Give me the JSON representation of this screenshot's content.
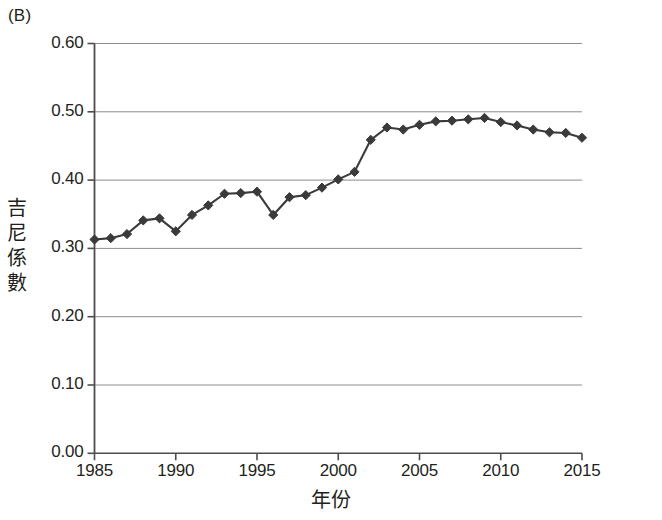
{
  "panel": {
    "label": "(B)"
  },
  "axes": {
    "y_label_chars": [
      "吉",
      "尼",
      "係",
      "數"
    ],
    "y_label": "吉尼係數",
    "x_label": "年份",
    "y_ticks": [
      "0.00",
      "0.10",
      "0.20",
      "0.30",
      "0.40",
      "0.50",
      "0.60"
    ],
    "x_ticks": [
      "1985",
      "1990",
      "1995",
      "2000",
      "2005",
      "2010",
      "2015"
    ]
  },
  "style": {
    "line_color": "#3a3a3a",
    "marker_color": "#3a3a3a",
    "grid_color": "#8c8c8c",
    "axis_color": "#4d4d4d",
    "text_color": "#231f20"
  },
  "chart_data": {
    "type": "line",
    "title": "(B)",
    "xlabel": "年份",
    "ylabel": "吉尼係數",
    "xlim": [
      1985,
      2015
    ],
    "ylim": [
      0.0,
      0.6
    ],
    "ytick_values": [
      0.0,
      0.1,
      0.2,
      0.3,
      0.4,
      0.5,
      0.6
    ],
    "xtick_values": [
      1985,
      1990,
      1995,
      2000,
      2005,
      2010,
      2015
    ],
    "grid": "horizontal",
    "legend": "none",
    "markers": "filled-diamond",
    "x": [
      1985,
      1986,
      1987,
      1988,
      1989,
      1990,
      1991,
      1992,
      1993,
      1994,
      1995,
      1996,
      1997,
      1998,
      1999,
      2000,
      2001,
      2002,
      2003,
      2004,
      2005,
      2006,
      2007,
      2008,
      2009,
      2010,
      2011,
      2012,
      2013,
      2014,
      2015
    ],
    "values": [
      0.313,
      0.315,
      0.321,
      0.341,
      0.344,
      0.325,
      0.349,
      0.363,
      0.38,
      0.381,
      0.383,
      0.349,
      0.375,
      0.378,
      0.389,
      0.401,
      0.412,
      0.459,
      0.477,
      0.474,
      0.481,
      0.486,
      0.487,
      0.489,
      0.491,
      0.485,
      0.48,
      0.474,
      0.47,
      0.469,
      0.462
    ],
    "series": [
      {
        "name": "吉尼係數",
        "values": [
          0.313,
          0.315,
          0.321,
          0.341,
          0.344,
          0.325,
          0.349,
          0.363,
          0.38,
          0.381,
          0.383,
          0.349,
          0.375,
          0.378,
          0.389,
          0.401,
          0.412,
          0.459,
          0.477,
          0.474,
          0.481,
          0.486,
          0.487,
          0.489,
          0.491,
          0.485,
          0.48,
          0.474,
          0.47,
          0.469,
          0.462
        ]
      }
    ]
  }
}
